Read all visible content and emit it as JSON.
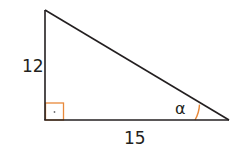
{
  "diagram": {
    "type": "right-triangle",
    "vertices": {
      "top": [
        45,
        10
      ],
      "bottom_left": [
        45,
        120
      ],
      "bottom_right": [
        229,
        120
      ]
    },
    "right_angle_at": "bottom_left",
    "labels": {
      "vertical_side": "12",
      "horizontal_side": "15",
      "angle": "α"
    },
    "colors": {
      "stroke": "#231f20",
      "accent": "#e8893a",
      "background": "#ffffff"
    }
  }
}
